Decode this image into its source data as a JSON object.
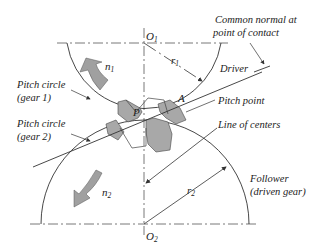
{
  "diagram": {
    "type": "gear-meshing",
    "labels": {
      "o1": "O",
      "o1_sub": "1",
      "o2": "O",
      "o2_sub": "2",
      "n1": "n",
      "n1_sub": "1",
      "n2": "n",
      "n2_sub": "2",
      "r1": "r",
      "r1_sub": "1",
      "r2": "r",
      "r2_sub": "2",
      "p": "P",
      "a": "A",
      "common_normal_line1": "Common normal at",
      "common_normal_line2": "point of contact",
      "driver": "Driver",
      "pitch_circle_gear1_line1": "Pitch circle",
      "pitch_circle_gear1_line2": "(gear 1)",
      "pitch_circle_gear2_line1": "Pitch circle",
      "pitch_circle_gear2_line2": "(gear 2)",
      "pitch_point": "Pitch point",
      "line_of_centers": "Line of centers",
      "follower_line1": "Follower",
      "follower_line2": "(driven gear)"
    },
    "colors": {
      "line": "#333333",
      "tooth_fill": "#a8a8a8",
      "arrow_fill": "#a0a0a0"
    }
  }
}
